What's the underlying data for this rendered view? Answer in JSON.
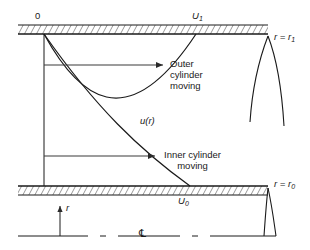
{
  "figure": {
    "type": "fluid-flow-velocity-profile-diagram",
    "labels": {
      "origin": "0",
      "upper_wall_velocity": "U",
      "upper_wall_velocity_sub": "1",
      "lower_wall_velocity": "U",
      "lower_wall_velocity_sub": "0",
      "velocity_function": "u(r)",
      "outer_annotation_line1": "Outer",
      "outer_annotation_line2": "cylinder",
      "outer_annotation_line3": "moving",
      "inner_annotation_line1": "Inner cylinder",
      "inner_annotation_line2": "moving",
      "radius_outer": "r = r",
      "radius_outer_sub": "1",
      "radius_inner": "r = r",
      "radius_inner_sub": "0",
      "radial_axis": "r",
      "centerline_symbol": "℄"
    },
    "colors": {
      "stroke": "#1a1a1a",
      "arrow": "#3a3a3a",
      "background": "#ffffff"
    },
    "geometry": {
      "upper_wall_y": 34,
      "lower_wall_y": 186,
      "wall_left_x": 18,
      "wall_right_x": 268,
      "left_vertical_x": 44,
      "curve_cross_x": 134,
      "curve_cross_y": 122,
      "outer_curve_end_x": 196,
      "inner_curve_end_x": 190,
      "centerline_y": 236,
      "radial_arrow_x": 60
    }
  }
}
